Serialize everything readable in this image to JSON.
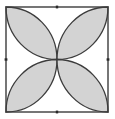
{
  "diagram": {
    "type": "geometric-figure",
    "square": {
      "x": 6,
      "y": 7,
      "width": 102,
      "height": 105
    },
    "center": {
      "x": 57,
      "y": 59.5
    },
    "midpoint_markers": [
      {
        "name": "top",
        "x": 57,
        "y": 7
      },
      {
        "name": "bottom",
        "x": 57,
        "y": 112
      },
      {
        "name": "left",
        "x": 6,
        "y": 59.5
      },
      {
        "name": "right",
        "x": 108,
        "y": 59.5
      }
    ],
    "petals": [
      "top-left",
      "top-right",
      "bottom-left",
      "bottom-right"
    ],
    "colors": {
      "fill": "#d3d3d3",
      "stroke": "#3c3c3c",
      "background": "#ffffff"
    }
  }
}
